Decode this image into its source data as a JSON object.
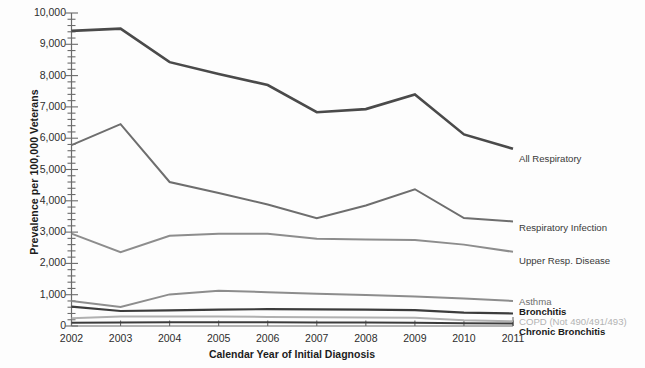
{
  "chart_data": {
    "type": "line",
    "title": "",
    "xlabel": "Calendar Year of Initial Diagnosis",
    "ylabel": "Prevalence per 100,000 Veterans",
    "categories": [
      "2002",
      "2003",
      "2004",
      "2005",
      "2006",
      "2007",
      "2008",
      "2009",
      "2010",
      "2011"
    ],
    "x": [
      2002,
      2003,
      2004,
      2005,
      2006,
      2007,
      2008,
      2009,
      2010,
      2011
    ],
    "ylim": [
      0,
      10000
    ],
    "xlim": [
      2002,
      2011
    ],
    "y_ticks": [
      0,
      1000,
      2000,
      3000,
      4000,
      5000,
      6000,
      7000,
      8000,
      9000,
      10000
    ],
    "y_tick_labels": [
      "0",
      "1,000",
      "2,000",
      "3,000",
      "4,000",
      "5,000",
      "6,000",
      "7,000",
      "8,000",
      "9,000",
      "10,000"
    ],
    "y_minor_tick_interval": 200,
    "grid": false,
    "legend_position": "right-inline",
    "series": [
      {
        "name": "All Respiratory",
        "color": "#4a4a4a",
        "width": 2.6,
        "values": [
          9430,
          9500,
          8430,
          8050,
          7700,
          6830,
          6930,
          7400,
          6120,
          5660
        ]
      },
      {
        "name": "Respiratory Infection",
        "color": "#6e6e6e",
        "width": 2.0,
        "values": [
          5780,
          6450,
          4600,
          4250,
          3880,
          3440,
          3850,
          4370,
          3450,
          3340
        ]
      },
      {
        "name": "Upper Resp. Disease",
        "color": "#8d8d8d",
        "width": 2.0,
        "values": [
          2950,
          2360,
          2880,
          2950,
          2950,
          2790,
          2760,
          2750,
          2600,
          2370
        ]
      },
      {
        "name": "Asthma",
        "color": "#8d8d8d",
        "width": 2.0,
        "values": [
          800,
          610,
          1010,
          1130,
          1080,
          1030,
          990,
          940,
          880,
          800
        ]
      },
      {
        "name": "Bronchitis",
        "color": "#3c3c3c",
        "width": 2.2,
        "values": [
          620,
          480,
          500,
          520,
          540,
          530,
          520,
          510,
          430,
          400
        ]
      },
      {
        "name": "COPD (Not 490/491/493)",
        "color": "#b0b0b0",
        "width": 2.0,
        "values": [
          250,
          300,
          300,
          300,
          290,
          280,
          270,
          260,
          180,
          150
        ]
      },
      {
        "name": "Chronic Bronchitis",
        "color": "#3c3c3c",
        "width": 2.0,
        "values": [
          100,
          110,
          120,
          120,
          120,
          115,
          110,
          105,
          90,
          80
        ]
      }
    ],
    "legend_entries": [
      {
        "label": "All Respiratory",
        "color": "#3a3a3a",
        "bold": false,
        "y": 154
      },
      {
        "label": "Respiratory Infection",
        "color": "#3a3a3a",
        "bold": false,
        "y": 223
      },
      {
        "label": "Upper Resp. Disease",
        "color": "#3a3a3a",
        "bold": false,
        "y": 256
      },
      {
        "label": "Asthma",
        "color": "#6e6e6e",
        "bold": false,
        "y": 297
      },
      {
        "label": "Bronchitis",
        "color": "#1a1a1a",
        "bold": true,
        "y": 307
      },
      {
        "label": "COPD (Not 490/491/493)",
        "color": "#b3b3b3",
        "bold": false,
        "y": 317
      },
      {
        "label": "Chronic Bronchitis",
        "color": "#1a1a1a",
        "bold": true,
        "y": 327
      }
    ]
  },
  "axes": {
    "frame_color": "#6b6b6b"
  }
}
